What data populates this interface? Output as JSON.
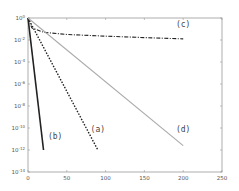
{
  "chart_data": {
    "type": "line",
    "title": "",
    "xlabel": "",
    "ylabel": "",
    "xlim": [
      0,
      250
    ],
    "ylim_log10": [
      -14,
      0
    ],
    "yscale": "log",
    "grid": false,
    "legend": "inline labels",
    "x_ticks": [
      "0",
      "50",
      "100",
      "150",
      "200",
      "250"
    ],
    "y_ticks": [
      {
        "base": "10",
        "exp": "0"
      },
      {
        "base": "10",
        "exp": "-2"
      },
      {
        "base": "10",
        "exp": "-4"
      },
      {
        "base": "10",
        "exp": "-6"
      },
      {
        "base": "10",
        "exp": "-8"
      },
      {
        "base": "10",
        "exp": "-10"
      },
      {
        "base": "10",
        "exp": "-12"
      },
      {
        "base": "10",
        "exp": "-14"
      }
    ],
    "series": [
      {
        "name": "(a)",
        "style": "dotted",
        "color": "#222222",
        "x": [
          0,
          90
        ],
        "log10_y": [
          0,
          -12
        ]
      },
      {
        "name": "(b)",
        "style": "solid",
        "color": "#222222",
        "x": [
          0,
          20
        ],
        "log10_y": [
          0,
          -12
        ]
      },
      {
        "name": "(c)",
        "style": "dash-dot",
        "color": "#222222",
        "x": [
          0,
          5,
          20,
          50,
          100,
          150,
          200
        ],
        "log10_y": [
          0,
          -0.9,
          -1.3,
          -1.5,
          -1.65,
          -1.78,
          -1.9
        ]
      },
      {
        "name": "(d)",
        "style": "solid",
        "color": "#aaaaaa",
        "x": [
          0,
          200
        ],
        "log10_y": [
          0,
          -11.6
        ]
      }
    ],
    "annotations": [
      {
        "text": "(a)",
        "x": 90,
        "log10_y": -10.4
      },
      {
        "text": "(b)",
        "x": 35,
        "log10_y": -11
      },
      {
        "text": "(c)",
        "x": 200,
        "log10_y": -0.8
      },
      {
        "text": "(d)",
        "x": 200,
        "log10_y": -10.4
      }
    ]
  }
}
